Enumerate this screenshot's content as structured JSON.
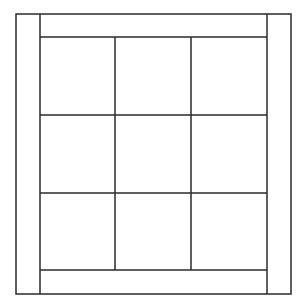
{
  "diagram": {
    "stroke_color": "#2a2a2a",
    "background": "#ffffff",
    "outer_frame": {
      "x": 16,
      "y": 14,
      "width": 275,
      "height": 280
    },
    "inner_columns_x": [
      40,
      115,
      191,
      267
    ],
    "inner_rows_y": [
      37,
      115,
      193,
      270
    ],
    "grid": {
      "rows": 3,
      "columns": 3
    }
  }
}
